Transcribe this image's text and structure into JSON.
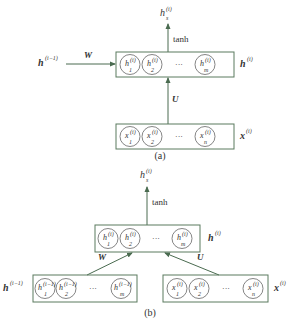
{
  "colors": {
    "box_border": "#5a7a5e",
    "arrow": "#4a6b50",
    "circle_border": "#666666",
    "text": "#333333"
  },
  "diagram_a": {
    "caption": "(a)",
    "output_label": "h",
    "output_sub": "s",
    "output_sup": "(i)",
    "activation": "tanh",
    "prev_state_label": "h",
    "prev_state_sup": "(i−1)",
    "weight_recurrent": "W",
    "weight_input": "U",
    "hidden_label": "h",
    "hidden_sup": "(i)",
    "input_label": "x",
    "input_sup": "(i)",
    "hidden_units": [
      {
        "base": "h",
        "sub": "1",
        "sup": "(i)"
      },
      {
        "base": "h",
        "sub": "2",
        "sup": "(i)"
      },
      {
        "base": "h",
        "sub": "m",
        "sup": "(i)"
      }
    ],
    "input_units": [
      {
        "base": "x",
        "sub": "1",
        "sup": "(i)"
      },
      {
        "base": "x",
        "sub": "2",
        "sup": "(i)"
      },
      {
        "base": "x",
        "sub": "n",
        "sup": "(i)"
      }
    ],
    "ellipsis": "···"
  },
  "diagram_b": {
    "caption": "(b)",
    "output_label": "h",
    "output_sub": "s",
    "output_sup": "(i)",
    "activation": "tanh",
    "prev_state_label": "h",
    "prev_state_sup": "(i−1)",
    "weight_recurrent": "W",
    "weight_input": "U",
    "hidden_label": "h",
    "hidden_sup": "(i)",
    "input_label": "x",
    "input_sup": "(i)",
    "hidden_units": [
      {
        "base": "h",
        "sub": "1",
        "sup": "(i)"
      },
      {
        "base": "h",
        "sub": "2",
        "sup": "(i)"
      },
      {
        "base": "h",
        "sub": "m",
        "sup": "(i)"
      }
    ],
    "prev_units": [
      {
        "base": "h",
        "sub": "1",
        "sup": "(i−1)"
      },
      {
        "base": "h",
        "sub": "2",
        "sup": "(i−1)"
      },
      {
        "base": "h",
        "sub": "m",
        "sup": "(i−1)"
      }
    ],
    "input_units": [
      {
        "base": "x",
        "sub": "1",
        "sup": "(i)"
      },
      {
        "base": "x",
        "sub": "2",
        "sup": "(i)"
      },
      {
        "base": "x",
        "sub": "n",
        "sup": "(i)"
      }
    ],
    "ellipsis": "···"
  }
}
